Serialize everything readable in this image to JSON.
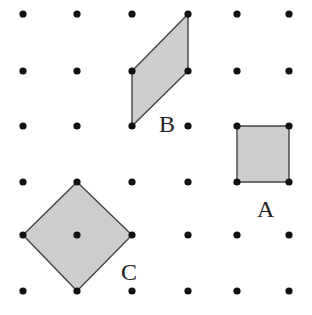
{
  "diagram": {
    "type": "dot-grid-shapes",
    "grid": {
      "columns_x": [
        23,
        77,
        132,
        188,
        237,
        289
      ],
      "rows_y": [
        14,
        71,
        126,
        182,
        235,
        291
      ],
      "dot_color": "#111111",
      "dot_radius": 3.6
    },
    "shapes": [
      {
        "label": "A",
        "kind": "square",
        "points": [
          [
            237,
            126
          ],
          [
            289,
            126
          ],
          [
            289,
            182
          ],
          [
            237,
            182
          ]
        ],
        "label_pos": [
          257,
          217
        ]
      },
      {
        "label": "B",
        "kind": "parallelogram",
        "points": [
          [
            188,
            14
          ],
          [
            188,
            71
          ],
          [
            132,
            126
          ],
          [
            132,
            71
          ]
        ],
        "label_pos": [
          159,
          132
        ]
      },
      {
        "label": "C",
        "kind": "rotated-square",
        "points": [
          [
            77,
            182
          ],
          [
            132,
            235
          ],
          [
            77,
            291
          ],
          [
            23,
            235
          ]
        ],
        "label_pos": [
          121,
          280
        ]
      }
    ],
    "fill_color": "#cdcdcd",
    "stroke_color": "#444444"
  }
}
